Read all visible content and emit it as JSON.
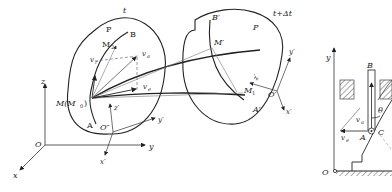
{
  "left_figure": {
    "time_label_t": "t",
    "time_label_t_dt": "t+Δt",
    "body_label_1": "P",
    "body_label_2": "P",
    "points": {
      "M": "M(M",
      "M0_sub": "0",
      "M_close": ")",
      "M2": "M",
      "M2_sub": "2",
      "B": "B",
      "A": "A",
      "O_double_prime": "O″",
      "B_prime": "B′",
      "M_prime": "M′",
      "M1": "M",
      "M1_sub": "1",
      "A_prime": "A′",
      "O_prime": "O′"
    },
    "velocity_labels": {
      "vr": "v",
      "vr_sub": "r",
      "va": "v",
      "va_sub": "a",
      "ve": "v",
      "ve_sub": "e"
    },
    "fixed_axes": {
      "origin": "O",
      "x": "x",
      "y": "y",
      "z": "z"
    },
    "moving_axes_1": {
      "x": "x′",
      "y": "y′",
      "z": "z′"
    },
    "moving_axes_2": {
      "x": "x′",
      "y": "y′",
      "z": "z′"
    }
  },
  "right_figure": {
    "axis_y": "y",
    "origin": "O",
    "rod_label": "B",
    "point_A": "A",
    "point_C": "C",
    "angle": "θ",
    "va": "v",
    "va_sub": "a",
    "ve": "v",
    "ve_sub": "e"
  }
}
